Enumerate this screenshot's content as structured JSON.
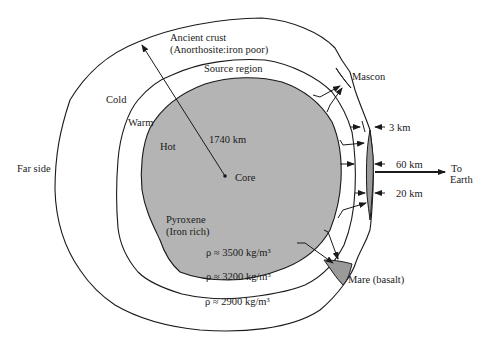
{
  "diagram": {
    "type": "cross-section",
    "colors": {
      "core_fill": "#b4b4b4",
      "mascon_fill": "#9a9a9a",
      "mare_fill": "#9a9a9a",
      "line": "#1a1a1a",
      "background": "#ffffff"
    },
    "labels": {
      "ancient_crust_line1": "Ancient crust",
      "ancient_crust_line2": "(Anorthosite:iron poor)",
      "source_region": "Source region",
      "mascon": "Mascon",
      "cold": "Cold",
      "warm": "Warm",
      "hot": "Hot",
      "radius": "1740 km",
      "core": "Core",
      "far_side": "Far side",
      "thickness_3km": "3 km",
      "thickness_60km": "60 km",
      "thickness_20km": "20 km",
      "to_earth_line1": "To",
      "to_earth_line2": "Earth",
      "pyroxene_line1": "Pyroxene",
      "pyroxene_line2": "(Iron rich)",
      "density_inner": "ρ ≈ 3500 kg/m³",
      "density_middle": "ρ ≈ 3200 kg/m³",
      "density_outer": "ρ ≈ 2900 kg/m³",
      "mare": "Mare (basalt)"
    },
    "layers": [
      {
        "name": "Core / hot interior",
        "composition": "Pyroxene (Iron rich)",
        "density": "ρ ≈ 3500 kg/m³",
        "temperature": "Hot"
      },
      {
        "name": "Source region",
        "density": "ρ ≈ 3200 kg/m³",
        "temperature": "Warm"
      },
      {
        "name": "Ancient crust",
        "composition": "Anorthosite: iron poor",
        "density": "ρ ≈ 2900 kg/m³",
        "temperature": "Cold"
      }
    ],
    "thicknesses": [
      "3 km",
      "60 km",
      "20 km"
    ],
    "radius": "1740 km"
  }
}
